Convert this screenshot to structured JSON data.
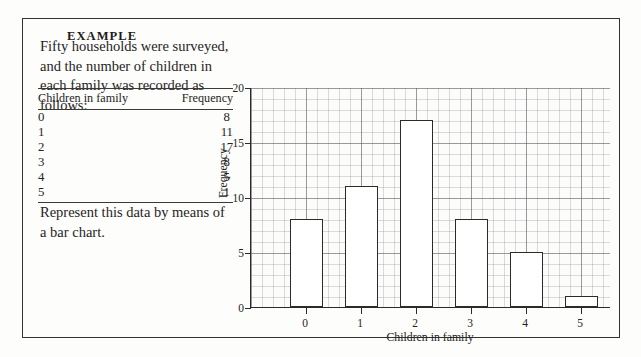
{
  "example": {
    "label": "EXAMPLE",
    "intro": "Fifty households were surveyed, and the number of children in each family was recorded as follows:",
    "outro": "Represent this data by means of a bar chart."
  },
  "table": {
    "headers": [
      "Children in family",
      "Frequency"
    ],
    "rows": [
      [
        "0",
        "8"
      ],
      [
        "1",
        "11"
      ],
      [
        "2",
        "17"
      ],
      [
        "3",
        "8"
      ],
      [
        "4",
        "5"
      ],
      [
        "5",
        "1"
      ]
    ]
  },
  "chart_data": {
    "type": "bar",
    "title": "",
    "categories": [
      "0",
      "1",
      "2",
      "3",
      "4",
      "5"
    ],
    "values": [
      8,
      11,
      17,
      8,
      5,
      1
    ],
    "xlabel": "Children in family",
    "ylabel": "Frequency",
    "ylim": [
      0,
      20
    ],
    "yticks": [
      0,
      5,
      10,
      15,
      20
    ],
    "ytick_labels": [
      "0",
      "5",
      "10",
      "15",
      "20"
    ],
    "xtick_labels": [
      "0",
      "1",
      "2",
      "3",
      "4",
      "5"
    ],
    "grid": true,
    "grid_minor": true,
    "legend": "none",
    "bar_fill": "#ffffff",
    "bar_edge": "#2b2b28"
  }
}
